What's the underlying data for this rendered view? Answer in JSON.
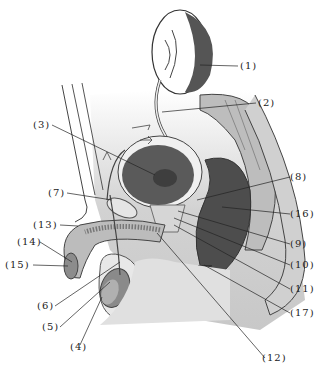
{
  "diagram": {
    "labels": [
      {
        "id": "1",
        "text": "(1)",
        "x": 240,
        "y": 60
      },
      {
        "id": "2",
        "text": "(2)",
        "x": 258,
        "y": 97
      },
      {
        "id": "3",
        "text": "(3)",
        "x": 33,
        "y": 119
      },
      {
        "id": "7",
        "text": "(7)",
        "x": 48,
        "y": 187
      },
      {
        "id": "8",
        "text": "(8)",
        "x": 290,
        "y": 171
      },
      {
        "id": "16",
        "text": "(16)",
        "x": 290,
        "y": 210
      },
      {
        "id": "13",
        "text": "(13)",
        "x": 36,
        "y": 219
      },
      {
        "id": "14",
        "text": "(14)",
        "x": 17,
        "y": 237
      },
      {
        "id": "9",
        "text": "(9)",
        "x": 290,
        "y": 239
      },
      {
        "id": "15",
        "text": "(15)",
        "x": 5,
        "y": 259
      },
      {
        "id": "10",
        "text": "(10)",
        "x": 290,
        "y": 260
      },
      {
        "id": "6",
        "text": "(6)",
        "x": 37,
        "y": 300
      },
      {
        "id": "11",
        "text": "(11)",
        "x": 290,
        "y": 283
      },
      {
        "id": "5",
        "text": "(5)",
        "x": 42,
        "y": 320
      },
      {
        "id": "17",
        "text": "(17)",
        "x": 290,
        "y": 307
      },
      {
        "id": "4",
        "text": "(4)",
        "x": 70,
        "y": 341
      },
      {
        "id": "12",
        "text": "(12)",
        "x": 262,
        "y": 353
      }
    ],
    "colors": {
      "background": "#ffffff",
      "outline": "#333333",
      "dark_organ": "#4a4a4a",
      "mid_tissue": "#9a9a9a",
      "light_tissue": "#d8d8d8",
      "cavity": "#cfcfcf"
    }
  }
}
